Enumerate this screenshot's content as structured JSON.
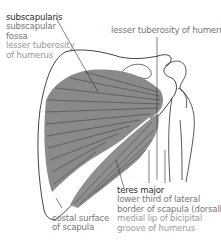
{
  "labels": {
    "subscapularis": {
      "name": "subscapularis",
      "origin": [
        "subscapular",
        "fossa"
      ],
      "insertion": [
        "lesser tuberosity",
        "of humerus"
      ]
    },
    "lesser_tuberosity": {
      "text": "lesser tuberosity of humerus"
    },
    "teres_major": {
      "name": "teres major",
      "origin": [
        "lower third of lateral",
        "border of scapula (dorsally)"
      ],
      "insertion": [
        "medial lip of bicipital",
        "groove of humerus"
      ]
    },
    "costal_surface": {
      "lines": [
        "costal surface",
        "of scapula"
      ]
    }
  },
  "colors": {
    "muscle_fill": "#8a8a8a",
    "muscle_fiber": "#3c3c3c",
    "bone_outline": "#2f2f2f",
    "text_dark": "#2a2a2a",
    "text_mid": "#777777",
    "text_light": "#9a9a9a"
  }
}
